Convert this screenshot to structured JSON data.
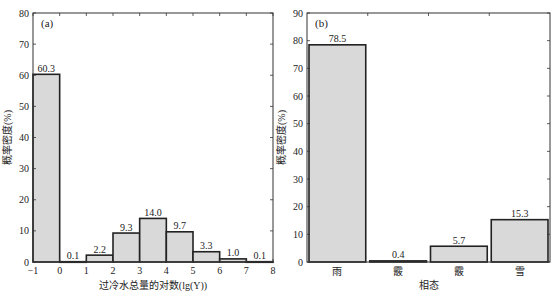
{
  "chart_data": [
    {
      "type": "bar",
      "panel": "(a)",
      "title": "",
      "xlabel": "过冷水总量的对数(lg(Y))",
      "ylabel": "概率密度(%)",
      "xlim": [
        -1,
        8
      ],
      "ylim": [
        0,
        80
      ],
      "xticks": [
        -1,
        0,
        1,
        2,
        3,
        4,
        5,
        6,
        7,
        8
      ],
      "yticks": [
        0,
        10,
        20,
        30,
        40,
        50,
        60,
        70,
        80
      ],
      "bins": [
        [
          -1,
          0
        ],
        [
          0,
          1
        ],
        [
          1,
          2
        ],
        [
          2,
          3
        ],
        [
          3,
          4
        ],
        [
          4,
          5
        ],
        [
          5,
          6
        ],
        [
          6,
          7
        ],
        [
          7,
          8
        ]
      ],
      "values": [
        60.3,
        0.1,
        2.2,
        9.3,
        14.0,
        9.7,
        3.3,
        1.0,
        0.1
      ],
      "value_labels": [
        "60.3",
        "0.1",
        "2.2",
        "9.3",
        "14.0",
        "9.7",
        "3.3",
        "1.0",
        "0.1"
      ],
      "grid": false,
      "bar_color": "#d9d9d9",
      "edge_color": "#222222"
    },
    {
      "type": "bar",
      "panel": "(b)",
      "title": "",
      "xlabel": "相态",
      "ylabel": "概率密度(%)",
      "ylim": [
        0,
        90
      ],
      "yticks": [
        0,
        10,
        20,
        30,
        40,
        50,
        60,
        70,
        80,
        90
      ],
      "categories": [
        "雨",
        "霰",
        "霰",
        "雪"
      ],
      "values": [
        78.5,
        0.4,
        5.7,
        15.3
      ],
      "value_labels": [
        "78.5",
        "0.4",
        "5.7",
        "15.3"
      ],
      "grid": false,
      "bar_color": "#d9d9d9",
      "edge_color": "#222222"
    }
  ]
}
